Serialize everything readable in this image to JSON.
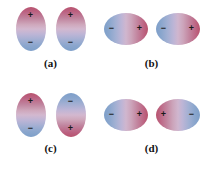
{
  "figure": {
    "type": "dipole-orientation-diagram",
    "background_color": "#ffffff",
    "positive_color": "#b8536e",
    "negative_color": "#7e9fc9",
    "sign_color": "#1a1a1a",
    "label_color": "#111111"
  },
  "panels": [
    {
      "id": "a",
      "label": "(a)",
      "orientation": "vertical",
      "dipoles": [
        {
          "shape": "vertical-ellipse",
          "gradient": "positive-top",
          "signs": [
            {
              "symbol": "+",
              "position": "top"
            },
            {
              "symbol": "−",
              "position": "bottom"
            }
          ]
        },
        {
          "shape": "vertical-ellipse",
          "gradient": "positive-top",
          "signs": [
            {
              "symbol": "+",
              "position": "top"
            },
            {
              "symbol": "−",
              "position": "bottom"
            }
          ]
        }
      ]
    },
    {
      "id": "b",
      "label": "(b)",
      "orientation": "horizontal",
      "dipoles": [
        {
          "shape": "horizontal-ellipse",
          "gradient": "negative-left",
          "signs": [
            {
              "symbol": "−",
              "position": "left"
            },
            {
              "symbol": "+",
              "position": "right"
            }
          ]
        },
        {
          "shape": "horizontal-ellipse",
          "gradient": "negative-left",
          "signs": [
            {
              "symbol": "−",
              "position": "left"
            },
            {
              "symbol": "+",
              "position": "right"
            }
          ]
        }
      ]
    },
    {
      "id": "c",
      "label": "(c)",
      "orientation": "vertical",
      "dipoles": [
        {
          "shape": "vertical-ellipse",
          "gradient": "positive-top",
          "signs": [
            {
              "symbol": "+",
              "position": "top"
            },
            {
              "symbol": "−",
              "position": "bottom"
            }
          ]
        },
        {
          "shape": "vertical-ellipse",
          "gradient": "negative-top",
          "signs": [
            {
              "symbol": "−",
              "position": "top"
            },
            {
              "symbol": "+",
              "position": "bottom"
            }
          ]
        }
      ]
    },
    {
      "id": "d",
      "label": "(d)",
      "orientation": "horizontal",
      "dipoles": [
        {
          "shape": "horizontal-ellipse",
          "gradient": "negative-left",
          "signs": [
            {
              "symbol": "−",
              "position": "left"
            },
            {
              "symbol": "+",
              "position": "right"
            }
          ]
        },
        {
          "shape": "horizontal-ellipse",
          "gradient": "positive-left",
          "signs": [
            {
              "symbol": "+",
              "position": "left"
            },
            {
              "symbol": "−",
              "position": "right"
            }
          ]
        }
      ]
    }
  ]
}
